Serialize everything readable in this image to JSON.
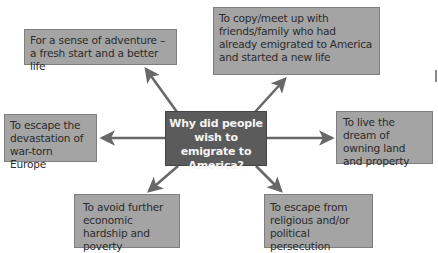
{
  "diagram": {
    "type": "spider-diagram",
    "center": {
      "label": "Why did people wish to emigrate to America?"
    },
    "reasons": [
      {
        "id": "adventure",
        "label": "For a sense of adventure – a fresh start and a better life"
      },
      {
        "id": "family",
        "label": "To copy/meet up with friends/family who had already emigrated to America and started a new life"
      },
      {
        "id": "land",
        "label": "To live the dream of owning land and property"
      },
      {
        "id": "persecution",
        "label": "To escape from religious and/or political persecution"
      },
      {
        "id": "hardship",
        "label": "To avoid further economic hardship and poverty"
      },
      {
        "id": "war",
        "label": "To escape the devastation of war-torn Europe"
      }
    ],
    "colors": {
      "center_fill": "#5b5b5b",
      "center_text": "#f4f4f4",
      "box_fill": "#a4a4a4",
      "box_border": "#7e7e7e",
      "arrow": "#686868"
    }
  }
}
